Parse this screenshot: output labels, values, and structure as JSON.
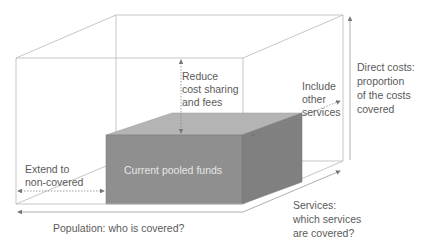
{
  "diagram": {
    "type": "3d-box-coverage",
    "inner_box": {
      "label": "Current pooled funds",
      "color": "#8f8f8f"
    },
    "axes": {
      "population": "Population: who is covered?",
      "services": [
        "Services:",
        "which services",
        "are covered?"
      ],
      "direct_costs": [
        "Direct costs:",
        "proportion",
        "of the costs",
        "covered"
      ]
    },
    "annotations": {
      "reduce": [
        "Reduce",
        "cost sharing",
        "and fees"
      ],
      "include": [
        "Include",
        "other",
        "services"
      ],
      "extend": [
        "Extend to",
        "non-covered"
      ]
    },
    "colors": {
      "outline": "#b5b5b5",
      "text": "#5a5a5a",
      "box_front": "#8f8f8f",
      "box_top": "#b4b4b4",
      "box_side": "#7e7e7e"
    }
  }
}
